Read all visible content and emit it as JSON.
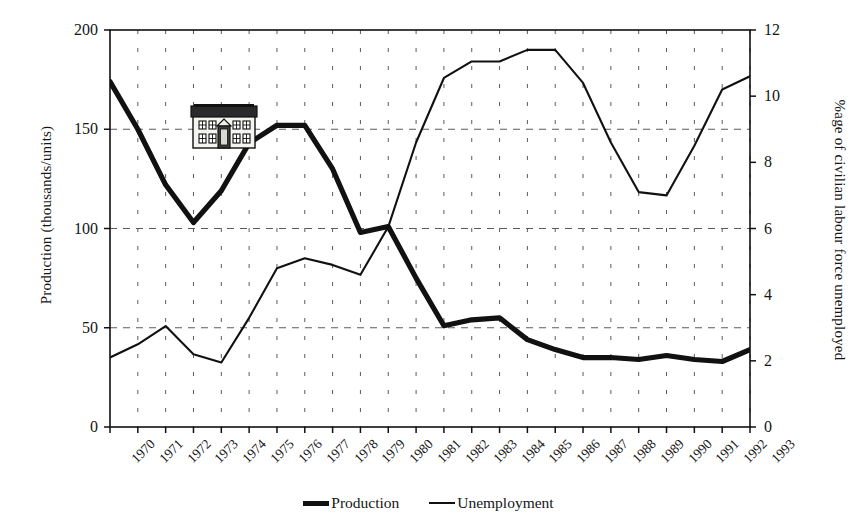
{
  "chart_data": {
    "type": "line",
    "title": "",
    "xlabel": "",
    "ylabel": "Production (thousands/units)",
    "y2label": "%age of civilian labour force unemployed",
    "grid": true,
    "legend_position": "bottom-center",
    "categories": [
      "1970",
      "1971",
      "1972",
      "1973",
      "1974",
      "1975",
      "1976",
      "1977",
      "1978",
      "1979",
      "1980",
      "1981",
      "1982",
      "1983",
      "1984",
      "1985",
      "1986",
      "1987",
      "1988",
      "1989",
      "1990",
      "1991",
      "1992",
      "1993"
    ],
    "ylim": [
      0,
      200
    ],
    "yticks": [
      0,
      50,
      100,
      150,
      200
    ],
    "y2lim": [
      0,
      12
    ],
    "y2ticks": [
      0,
      2,
      4,
      6,
      8,
      10,
      12
    ],
    "series": [
      {
        "name": "Production",
        "axis": "left",
        "units": "thousands/units",
        "line_width": "thick",
        "color": "#111111",
        "values": [
          174,
          150,
          122,
          103,
          119,
          143,
          152,
          152,
          130,
          98,
          101,
          75,
          51,
          54,
          55,
          44,
          39,
          35,
          35,
          34,
          36,
          34,
          33,
          39
        ]
      },
      {
        "name": "Unemployment",
        "axis": "right",
        "units": "%age of civilian labour force",
        "line_width": "thin",
        "color": "#111111",
        "values": [
          2.1,
          2.5,
          3.05,
          2.2,
          1.95,
          3.3,
          4.8,
          5.1,
          4.9,
          4.6,
          6.05,
          8.6,
          10.55,
          11.05,
          11.05,
          11.4,
          11.4,
          10.4,
          8.6,
          7.1,
          7.0,
          8.5,
          10.2,
          10.6
        ]
      }
    ]
  },
  "axes": {
    "left": {
      "title": "Production (thousands/units)",
      "ticks": [
        "200",
        "150",
        "100",
        "50",
        "0"
      ]
    },
    "right": {
      "title": "%age of civilian labour force unemployed",
      "ticks": [
        "12",
        "10",
        "8",
        "6",
        "4",
        "2",
        "0"
      ]
    },
    "bottom": {
      "ticks": [
        "1970",
        "1971",
        "1972",
        "1973",
        "1974",
        "1975",
        "1976",
        "1977",
        "1978",
        "1979",
        "1980",
        "1981",
        "1982",
        "1983",
        "1984",
        "1985",
        "1986",
        "1987",
        "1988",
        "1989",
        "1990",
        "1991",
        "1992",
        "1993"
      ]
    }
  },
  "legend": {
    "items": [
      {
        "label": "Production",
        "style": "thick",
        "color": "#111111"
      },
      {
        "label": "Unemployment",
        "style": "thin",
        "color": "#111111"
      }
    ]
  },
  "decoration": {
    "house_icon": {
      "name": "house-clipart",
      "roof_color": "#252525",
      "wall_color": "#f2f2ee",
      "outline_color": "#111111",
      "window_count": 8,
      "door_count": 1
    }
  },
  "style": {
    "background": "#ffffff",
    "axis_color": "#111111",
    "grid_color": "#5b5b5b",
    "text_color": "#151515"
  }
}
